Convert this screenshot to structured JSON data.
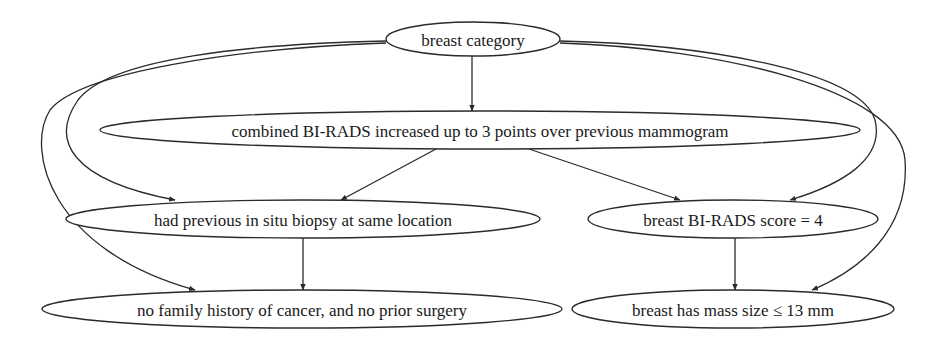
{
  "diagram": {
    "type": "directed-graph",
    "background": "#ffffff",
    "line_color": "#2b2b2b",
    "nodes": [
      {
        "id": "n0",
        "label": "breast category",
        "shape": "ellipse",
        "cx": 473,
        "cy": 39,
        "rx": 87,
        "ry": 17
      },
      {
        "id": "n1",
        "label": "combined BI-RADS increased up to 3 points over previous mammogram",
        "shape": "ellipse",
        "cx": 480,
        "cy": 130,
        "rx": 380,
        "ry": 19
      },
      {
        "id": "n2",
        "label": "had previous in situ biopsy at same location",
        "shape": "ellipse",
        "cx": 303,
        "cy": 219,
        "rx": 237,
        "ry": 19
      },
      {
        "id": "n3",
        "label": "breast BI-RADS score = 4",
        "shape": "ellipse",
        "cx": 733,
        "cy": 219,
        "rx": 145,
        "ry": 19
      },
      {
        "id": "n4",
        "label": "no family history of cancer, and no prior surgery",
        "shape": "ellipse",
        "cx": 302,
        "cy": 309,
        "rx": 260,
        "ry": 19
      },
      {
        "id": "n5",
        "label": "breast has mass size ≤ 13 mm",
        "shape": "ellipse",
        "cx": 733,
        "cy": 309,
        "rx": 161,
        "ry": 19
      }
    ],
    "edges": [
      {
        "from": "n0",
        "to": "n1",
        "path": "M472,56 L472,111"
      },
      {
        "from": "n1",
        "to": "n2",
        "path": "M436,149 L341,200"
      },
      {
        "from": "n1",
        "to": "n3",
        "path": "M529,149 L680,200"
      },
      {
        "from": "n2",
        "to": "n4",
        "path": "M303,238 L303,290"
      },
      {
        "from": "n3",
        "to": "n5",
        "path": "M735,238 L735,290"
      },
      {
        "from": "n0",
        "to": "n2",
        "path": "M386,41 C250,44 110,58 78,100 C50,140 70,180 175,200"
      },
      {
        "from": "n0",
        "to": "n4",
        "path": "M386,43 C240,48 80,72 50,110 C25,150 50,250 195,290"
      },
      {
        "from": "n0",
        "to": "n3",
        "path": "M560,41 C700,44 860,70 875,120 C885,160 840,185 790,200"
      },
      {
        "from": "n0",
        "to": "n5",
        "path": "M560,43 C720,48 900,90 905,160 C910,230 860,270 812,290"
      }
    ]
  }
}
